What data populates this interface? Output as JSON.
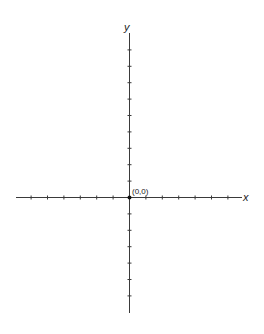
{
  "diagram": {
    "type": "cartesian-axes",
    "x_axis_label": "x",
    "y_axis_label": "y",
    "origin_label": "(0,0)",
    "x_ticks_left": 6,
    "x_ticks_right": 6,
    "y_ticks_up": 9,
    "y_ticks_down": 6,
    "tick_spacing_px": 16.4
  }
}
